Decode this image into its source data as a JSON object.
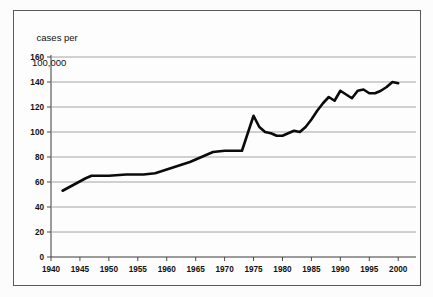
{
  "figure": {
    "y_axis_caption_line1": "cases per",
    "y_axis_caption_line2": "100,000"
  },
  "chart_data": {
    "type": "line",
    "title": "",
    "subtitle": "",
    "xlabel": "",
    "ylabel": "cases per 100,000",
    "xlim": [
      1940,
      2001
    ],
    "ylim": [
      0,
      160
    ],
    "grid": true,
    "legend": false,
    "legend_position": "none",
    "xticks": [
      1940,
      1945,
      1950,
      1955,
      1960,
      1965,
      1970,
      1975,
      1980,
      1985,
      1990,
      1995,
      2000
    ],
    "xtick_labels": [
      "1940",
      "1945",
      "1950",
      "1955",
      "1960",
      "1965",
      "1970",
      "1975",
      "1980",
      "1985",
      "1990",
      "1995",
      "2000"
    ],
    "yticks": [
      0,
      20,
      40,
      60,
      80,
      100,
      120,
      140,
      160
    ],
    "ytick_labels": [
      "0",
      "20",
      "40",
      "60",
      "80",
      "100",
      "120",
      "140",
      "160"
    ],
    "series": [
      {
        "name": "cases per 100,000",
        "color": "#0b0b0b",
        "x": [
          1942,
          1944,
          1946,
          1947,
          1950,
          1953,
          1956,
          1958,
          1960,
          1962,
          1964,
          1966,
          1968,
          1970,
          1972,
          1973,
          1974,
          1975,
          1976,
          1977,
          1978,
          1979,
          1980,
          1981,
          1982,
          1983,
          1984,
          1985,
          1986,
          1987,
          1988,
          1989,
          1990,
          1991,
          1992,
          1993,
          1994,
          1995,
          1996,
          1997,
          1998,
          1999,
          2000
        ],
        "values": [
          53,
          58,
          63,
          65,
          65,
          66,
          66,
          67,
          70,
          73,
          76,
          80,
          84,
          85,
          85,
          85,
          99,
          113,
          104,
          100,
          99,
          97,
          97,
          99,
          101,
          100,
          104,
          110,
          117,
          123,
          128,
          125,
          133,
          130,
          127,
          133,
          134,
          131,
          131,
          133,
          136,
          140,
          139
        ]
      }
    ]
  }
}
